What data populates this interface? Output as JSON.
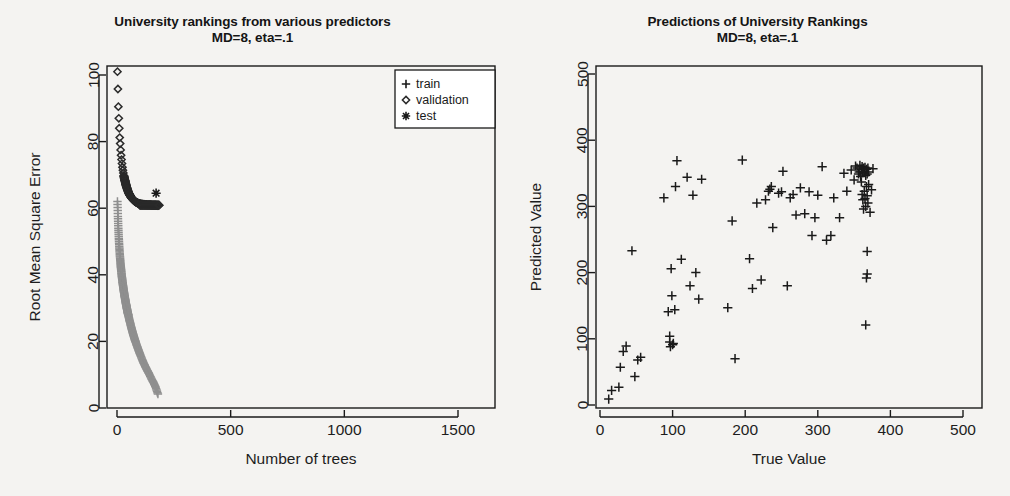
{
  "figure": {
    "background": "#f4f3f1",
    "panels": 2
  },
  "left": {
    "title_line1": "University rankings from various predictors",
    "title_line2": "MD=8, eta=.1",
    "xlabel": "Number of trees",
    "ylabel": "Root Mean Square Error",
    "xticks": [
      "0",
      "500",
      "1000",
      "1500"
    ],
    "yticks": [
      "0",
      "20",
      "40",
      "60",
      "80",
      "100"
    ],
    "legend": [
      {
        "marker": "plus-icon",
        "label": "train",
        "glyph": "+"
      },
      {
        "marker": "diamond-icon",
        "label": "validation",
        "glyph": "◇"
      },
      {
        "marker": "asterisk-icon",
        "label": "test",
        "glyph": "✳"
      }
    ]
  },
  "right": {
    "title_line1": "Predictions of University Rankings",
    "title_line2": "MD=8, eta=.1",
    "xlabel": "True Value",
    "ylabel": "Predicted Value",
    "xticks": [
      "0",
      "100",
      "200",
      "300",
      "400",
      "500"
    ],
    "yticks": [
      "0",
      "100",
      "200",
      "300",
      "400",
      "500"
    ]
  },
  "chart_data": [
    {
      "type": "line",
      "id": "rmse-vs-trees",
      "title": "University rankings from various predictors MD=8, eta=.1",
      "xlabel": "Number of trees",
      "ylabel": "Root Mean Square Error",
      "xlim": [
        0,
        1700
      ],
      "ylim": [
        0,
        104
      ],
      "grid": false,
      "legend_position": "top-right",
      "legend": [
        "train",
        "validation",
        "test"
      ],
      "series": [
        {
          "name": "validation",
          "marker": "diamond",
          "color": "#2b2b2b",
          "x": [
            2,
            4,
            6,
            8,
            10,
            12,
            14,
            16,
            18,
            20,
            22,
            24,
            26,
            28,
            30,
            32,
            34,
            36,
            38,
            40,
            42,
            45,
            48,
            52,
            56,
            60,
            65,
            70,
            76,
            82,
            90,
            100,
            110,
            122,
            134,
            146,
            158,
            170,
            182
          ],
          "y": [
            101.0,
            95.8,
            90.5,
            87.0,
            84.0,
            81.2,
            79.4,
            77.5,
            75.9,
            74.6,
            73.4,
            72.3,
            71.4,
            70.6,
            69.8,
            69.1,
            68.5,
            68.0,
            67.4,
            66.9,
            66.4,
            65.8,
            65.2,
            64.5,
            64.0,
            63.5,
            63.0,
            62.6,
            62.2,
            61.9,
            61.6,
            61.3,
            61.2,
            61.1,
            61.0,
            61.0,
            60.9,
            60.9,
            60.8
          ]
        },
        {
          "name": "train",
          "marker": "plus",
          "color": "#8f8f8f",
          "x": [
            2,
            4,
            6,
            8,
            10,
            12,
            14,
            16,
            18,
            20,
            22,
            24,
            26,
            28,
            30,
            32,
            34,
            36,
            38,
            40,
            42,
            44,
            46,
            48,
            50,
            54,
            58,
            62,
            66,
            70,
            74,
            78,
            82,
            88,
            94,
            100,
            108,
            116,
            124,
            132,
            140,
            150,
            160,
            170,
            180
          ],
          "y": [
            62.0,
            57.5,
            54.0,
            51.0,
            48.5,
            46.4,
            44.6,
            43.0,
            41.6,
            40.3,
            39.1,
            38.0,
            37.0,
            36.0,
            35.1,
            34.2,
            33.4,
            32.6,
            31.8,
            31.1,
            30.4,
            29.7,
            29.0,
            28.4,
            27.8,
            26.6,
            25.5,
            24.4,
            23.4,
            22.4,
            21.5,
            20.6,
            19.8,
            18.6,
            17.5,
            16.4,
            15.0,
            13.7,
            12.5,
            11.4,
            10.4,
            9.0,
            7.7,
            6.2,
            4.2
          ]
        },
        {
          "name": "test",
          "marker": "asterisk",
          "color": "#1a1a1a",
          "x": [
            172
          ],
          "y": [
            64.5
          ]
        }
      ]
    },
    {
      "type": "scatter",
      "id": "predicted-vs-true",
      "title": "Predictions of University Rankings MD=8, eta=.1",
      "xlabel": "True Value",
      "ylabel": "Predicted Value",
      "xlim": [
        0,
        520
      ],
      "ylim": [
        0,
        520
      ],
      "grid": false,
      "marker": "plus",
      "color": "#1a1a1a",
      "points": [
        [
          12,
          9
        ],
        [
          16,
          22
        ],
        [
          26,
          27
        ],
        [
          28,
          57
        ],
        [
          32,
          81
        ],
        [
          36,
          89
        ],
        [
          44,
          233
        ],
        [
          48,
          43
        ],
        [
          52,
          68
        ],
        [
          56,
          72
        ],
        [
          88,
          313
        ],
        [
          94,
          141
        ],
        [
          96,
          104
        ],
        [
          96,
          95
        ],
        [
          97,
          88
        ],
        [
          98,
          206
        ],
        [
          99,
          165
        ],
        [
          100,
          91
        ],
        [
          101,
          93
        ],
        [
          103,
          144
        ],
        [
          104,
          330
        ],
        [
          106,
          369
        ],
        [
          112,
          220
        ],
        [
          120,
          344
        ],
        [
          124,
          180
        ],
        [
          128,
          317
        ],
        [
          132,
          200
        ],
        [
          136,
          160
        ],
        [
          140,
          341
        ],
        [
          176,
          147
        ],
        [
          182,
          278
        ],
        [
          186,
          70
        ],
        [
          196,
          370
        ],
        [
          206,
          221
        ],
        [
          210,
          176
        ],
        [
          216,
          305
        ],
        [
          222,
          189
        ],
        [
          228,
          310
        ],
        [
          232,
          323
        ],
        [
          234,
          326
        ],
        [
          236,
          330
        ],
        [
          238,
          268
        ],
        [
          246,
          320
        ],
        [
          250,
          322
        ],
        [
          252,
          353
        ],
        [
          258,
          180
        ],
        [
          262,
          313
        ],
        [
          266,
          318
        ],
        [
          270,
          287
        ],
        [
          276,
          328
        ],
        [
          282,
          289
        ],
        [
          288,
          322
        ],
        [
          292,
          256
        ],
        [
          296,
          283
        ],
        [
          300,
          317
        ],
        [
          306,
          360
        ],
        [
          312,
          249
        ],
        [
          318,
          256
        ],
        [
          322,
          313
        ],
        [
          330,
          283
        ],
        [
          336,
          350
        ],
        [
          340,
          323
        ],
        [
          346,
          355
        ],
        [
          350,
          340
        ],
        [
          352,
          361
        ],
        [
          354,
          358
        ],
        [
          356,
          349
        ],
        [
          357,
          352
        ],
        [
          358,
          362
        ],
        [
          359,
          345
        ],
        [
          360,
          356
        ],
        [
          360,
          337
        ],
        [
          361,
          360
        ],
        [
          361,
          318
        ],
        [
          362,
          351
        ],
        [
          362,
          310
        ],
        [
          363,
          358
        ],
        [
          363,
          296
        ],
        [
          364,
          353
        ],
        [
          364,
          323
        ],
        [
          365,
          359
        ],
        [
          365,
          312
        ],
        [
          366,
          347
        ],
        [
          366,
          300
        ],
        [
          367,
          356
        ],
        [
          367,
          330
        ],
        [
          368,
          349
        ],
        [
          368,
          316
        ],
        [
          369,
          358
        ],
        [
          369,
          305
        ],
        [
          370,
          352
        ],
        [
          370,
          333
        ],
        [
          368,
          232
        ],
        [
          368,
          198
        ],
        [
          367,
          192
        ],
        [
          366,
          121
        ],
        [
          372,
          291
        ],
        [
          374,
          325
        ],
        [
          376,
          357
        ]
      ]
    }
  ]
}
